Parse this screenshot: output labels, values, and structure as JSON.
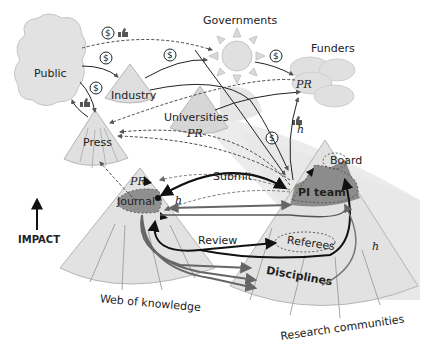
{
  "labels": {
    "public": "Public",
    "industry": "Industry",
    "governments": "Governments",
    "funders": "Funders",
    "funders_pr": "PR",
    "universities": "Universities",
    "universities_pr": "PR",
    "press": "Press",
    "journal": "Journal",
    "journal_pr": "PR",
    "pi_team": "PI team",
    "board": "Board",
    "referees": "Referees",
    "disciplines": "Disciplines",
    "web_of_knowledge": "Web of knowledge",
    "research_communities": "Research communities",
    "impact": "IMPACT",
    "submit": "Submit",
    "review": "Review",
    "h_index_1": "h",
    "h_index_2": "h",
    "h_index_3": "h"
  },
  "icons": {
    "money": "$",
    "like": "thumbs-up"
  },
  "colors": {
    "fill_light": "#e2e2e2",
    "fill_mid": "#d2d2d2",
    "fill_dark": "#8c8c8c",
    "stroke": "#999999",
    "arrow_dark": "#111111",
    "arrow_grey": "#666666"
  }
}
